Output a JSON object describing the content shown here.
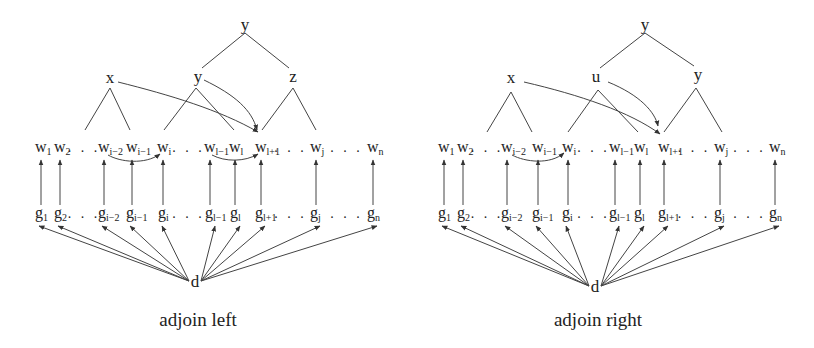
{
  "diagrams": [
    {
      "id": "left",
      "caption": "adjoin left",
      "tree_nodes": [
        {
          "key": "root",
          "label": "y",
          "x": 245,
          "y": 30
        },
        {
          "key": "x",
          "label": "x",
          "x": 110,
          "y": 83
        },
        {
          "key": "mid",
          "label": "y",
          "x": 198,
          "y": 82
        },
        {
          "key": "right",
          "label": "z",
          "x": 293,
          "y": 82
        }
      ],
      "words": [
        {
          "base": "w",
          "sub": "1",
          "x": 41
        },
        {
          "base": "w",
          "sub": "2",
          "x": 60
        },
        {
          "base": "w",
          "sub": "i−2",
          "x": 104
        },
        {
          "base": "w",
          "sub": "i−1",
          "x": 132
        },
        {
          "base": "w",
          "sub": "i",
          "x": 163
        },
        {
          "base": "w",
          "sub": "l−1",
          "x": 210
        },
        {
          "base": "w",
          "sub": "l",
          "x": 235
        },
        {
          "base": "w",
          "sub": "l+1",
          "x": 261
        },
        {
          "base": "w",
          "sub": "j",
          "x": 316
        },
        {
          "base": "w",
          "sub": "n",
          "x": 373
        }
      ],
      "genes": [
        {
          "base": "g",
          "sub": "1",
          "x": 41
        },
        {
          "base": "g",
          "sub": "2",
          "x": 60
        },
        {
          "base": "g",
          "sub": "i−2",
          "x": 104
        },
        {
          "base": "g",
          "sub": "i−1",
          "x": 132
        },
        {
          "base": "g",
          "sub": "i",
          "x": 164
        },
        {
          "base": "g",
          "sub": "l−1",
          "x": 211
        },
        {
          "base": "g",
          "sub": "l",
          "x": 236
        },
        {
          "base": "g",
          "sub": "l+1",
          "x": 261
        },
        {
          "base": "g",
          "sub": "j",
          "x": 316
        },
        {
          "base": "g",
          "sub": "n",
          "x": 373
        }
      ],
      "dots_after": [
        "w2",
        "wi",
        "wl+1",
        "wj"
      ],
      "d_label": "d",
      "d": {
        "x": 195,
        "y": 287
      }
    },
    {
      "id": "right",
      "caption": "adjoin right",
      "tree_nodes": [
        {
          "key": "root",
          "label": "y",
          "x": 645,
          "y": 30
        },
        {
          "key": "x",
          "label": "x",
          "x": 511,
          "y": 83
        },
        {
          "key": "mid",
          "label": "u",
          "x": 596,
          "y": 82
        },
        {
          "key": "right",
          "label": "y",
          "x": 698,
          "y": 80
        }
      ],
      "words": [
        {
          "base": "w",
          "sub": "1",
          "x": 444
        },
        {
          "base": "w",
          "sub": "2",
          "x": 463
        },
        {
          "base": "w",
          "sub": "i−2",
          "x": 507
        },
        {
          "base": "w",
          "sub": "i−1",
          "x": 538
        },
        {
          "base": "w",
          "sub": "i",
          "x": 568
        },
        {
          "base": "w",
          "sub": "l−1",
          "x": 615
        },
        {
          "base": "w",
          "sub": "l",
          "x": 640
        },
        {
          "base": "w",
          "sub": "l+1",
          "x": 664
        },
        {
          "base": "w",
          "sub": "j",
          "x": 720
        },
        {
          "base": "w",
          "sub": "n",
          "x": 775
        }
      ],
      "genes": [
        {
          "base": "g",
          "sub": "1",
          "x": 444
        },
        {
          "base": "g",
          "sub": "2",
          "x": 463
        },
        {
          "base": "g",
          "sub": "i−2",
          "x": 507
        },
        {
          "base": "g",
          "sub": "i−1",
          "x": 538
        },
        {
          "base": "g",
          "sub": "i",
          "x": 568
        },
        {
          "base": "g",
          "sub": "l−1",
          "x": 615
        },
        {
          "base": "g",
          "sub": "l",
          "x": 640
        },
        {
          "base": "g",
          "sub": "l+1",
          "x": 664
        },
        {
          "base": "g",
          "sub": "j",
          "x": 720
        },
        {
          "base": "g",
          "sub": "n",
          "x": 775
        }
      ],
      "dots_after": [
        "w2",
        "wi",
        "wl+1",
        "wj"
      ],
      "d_label": "d",
      "d": {
        "x": 595,
        "y": 292
      }
    }
  ],
  "layout": {
    "word_baseline": 152,
    "gene_baseline": 218,
    "arrow_top": 160,
    "arrow_bottom": 205,
    "caption_y": 326,
    "line_color": "#444444",
    "text_color": "#222222"
  }
}
